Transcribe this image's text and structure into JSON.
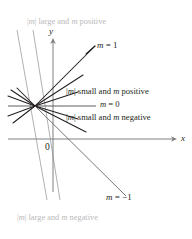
{
  "figure": {
    "type": "geometry-diagram",
    "background": "#ffffff",
    "ink": "#231f20",
    "faint_ink": "#b9b9bb",
    "axis_ink": "#6f7072",
    "width": 192,
    "height": 239
  },
  "axes": {
    "x_label": "x",
    "y_label": "y",
    "origin_label": "0",
    "x_axis_y": 139,
    "y_axis_x": 53,
    "origin_x": 53,
    "origin_y": 139
  },
  "pencil_point": {
    "x": 35,
    "y": 106,
    "description": "common point through which all lines pass"
  },
  "annotations": [
    {
      "id": "large-positive",
      "text": "|m| large and m positive",
      "style": "faint",
      "x": 27,
      "y": 19
    },
    {
      "id": "slope-one",
      "text": "m = 1",
      "style": "slope-tag",
      "x": 97,
      "y": 42
    },
    {
      "id": "small-positive",
      "text": "|m| small and m positive",
      "style": "annot",
      "x": 66,
      "y": 88
    },
    {
      "id": "slope-zero",
      "text": "m = 0",
      "style": "annot",
      "x": 100,
      "y": 101
    },
    {
      "id": "small-negative",
      "text": "|m| small and m negative",
      "style": "annot",
      "x": 66,
      "y": 114
    },
    {
      "id": "slope-negative-one",
      "text": "m = −1",
      "style": "slope-tag",
      "x": 106,
      "y": 194
    },
    {
      "id": "large-negative",
      "text": "|m| large and m negative",
      "style": "faint",
      "x": 17,
      "y": 215
    }
  ],
  "lines": [
    {
      "id": "steep-up-left",
      "slope_class": "large positive",
      "x1": 17,
      "y1": 30,
      "x2": 47,
      "y2": 200
    },
    {
      "id": "steep-up-right",
      "slope_class": "large negative",
      "x1": 33,
      "y1": 30,
      "x2": 60,
      "y2": 200
    },
    {
      "id": "slope-one-line",
      "slope_class": "m = 1",
      "x1": 35,
      "y1": 106,
      "x2": 95,
      "y2": 46
    },
    {
      "id": "moderate-positive",
      "slope_class": "positive",
      "x1": 35,
      "y1": 106,
      "x2": 83,
      "y2": 75
    },
    {
      "id": "small-positive-line",
      "slope_class": "small positive",
      "x1": 35,
      "y1": 106,
      "x2": 78,
      "y2": 92
    },
    {
      "id": "zero-line",
      "slope_class": "m = 0",
      "x1": 8,
      "y1": 106,
      "x2": 96,
      "y2": 106
    },
    {
      "id": "small-negative-line",
      "slope_class": "small negative",
      "x1": 35,
      "y1": 106,
      "x2": 78,
      "y2": 119
    },
    {
      "id": "moderate-negative",
      "slope_class": "negative",
      "x1": 35,
      "y1": 106,
      "x2": 86,
      "y2": 132
    },
    {
      "id": "slope-neg-one-line",
      "slope_class": "m = −1",
      "x1": 35,
      "y1": 106,
      "x2": 120,
      "y2": 190
    },
    {
      "id": "back-up-left-a",
      "slope_class": "small positive (left ray)",
      "x1": 35,
      "y1": 106,
      "x2": 8,
      "y2": 96
    },
    {
      "id": "back-up-left-b",
      "slope_class": "moderate positive (left ray)",
      "x1": 35,
      "y1": 106,
      "x2": 10,
      "y2": 90
    },
    {
      "id": "back-down-left-a",
      "slope_class": "small negative (left ray)",
      "x1": 35,
      "y1": 106,
      "x2": 8,
      "y2": 116
    },
    {
      "id": "back-down-left-b",
      "slope_class": "moderate negative (left ray)",
      "x1": 35,
      "y1": 106,
      "x2": 12,
      "y2": 123
    },
    {
      "id": "back-neg-one-left",
      "slope_class": "m = −1 (left ray)",
      "x1": 35,
      "y1": 106,
      "x2": 16,
      "y2": 88
    }
  ],
  "chart_data": {
    "type": "line",
    "xlabel": "x",
    "ylabel": "y",
    "grid": false,
    "legend": "inline-annotations",
    "series": [
      {
        "name": "m = 1",
        "slope": 1,
        "label": "m = 1"
      },
      {
        "name": "m = 0",
        "slope": 0,
        "label": "m = 0"
      },
      {
        "name": "m = -1",
        "slope": -1,
        "label": "m = −1"
      },
      {
        "name": "|m| small and m positive",
        "slope_range": "0 < m < 1"
      },
      {
        "name": "|m| small and m negative",
        "slope_range": "-1 < m < 0"
      },
      {
        "name": "|m| large and m positive",
        "slope_range": "m >> 1"
      },
      {
        "name": "|m| large and m negative",
        "slope_range": "m << -1"
      }
    ]
  }
}
